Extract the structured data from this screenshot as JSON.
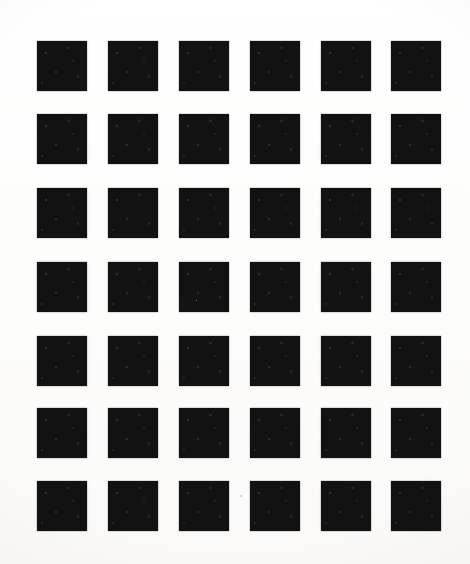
{
  "document": {
    "title": "Square Grid Test Pattern",
    "kind": "scanned-print",
    "canvas": {
      "width": 470,
      "height": 564
    },
    "background_color": "#fefefe",
    "ink_color": "#121212"
  },
  "pattern": {
    "name": "uniform-square-grid",
    "columns": 6,
    "rows": 7,
    "total_squares": 42,
    "square_width": 50,
    "square_height": 50,
    "column_pitch": 71,
    "row_pitch": 73.3,
    "column_gap": 21,
    "row_gap": 23,
    "margin_left": 37,
    "margin_top": 41,
    "margin_right": 30,
    "margin_bottom": 33,
    "column_x": [
      37,
      108,
      179,
      250,
      321,
      391
    ],
    "row_y": [
      41,
      114,
      188,
      262,
      336,
      408,
      481
    ]
  },
  "artifacts": {
    "specks": [
      {
        "x": 240,
        "y": 495,
        "size": 2
      },
      {
        "x": 196,
        "y": 300,
        "size": 1
      }
    ]
  }
}
